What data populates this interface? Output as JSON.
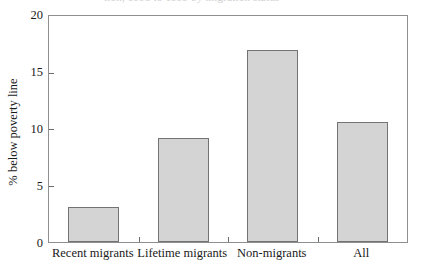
{
  "figure": {
    "top_clipped_text": "tion, 1993 to 1999 by migration status",
    "bar_fill_color": "#d4d4d4",
    "bar_edge_color": "#737373",
    "frame_color": "#8f8f8f"
  },
  "chart_data": {
    "type": "bar",
    "title": "",
    "subtitle": "",
    "xlabel": "",
    "ylabel": "% below poverty line",
    "categories": [
      "Recent migrants",
      "Lifetime migrants",
      "Non-migrants",
      "All"
    ],
    "values": [
      3.1,
      9.2,
      17.0,
      10.6
    ],
    "series": [
      {
        "name": "% below poverty line",
        "values": [
          3.1,
          9.2,
          17.0,
          10.6
        ]
      }
    ],
    "ylim": [
      0,
      20
    ],
    "ytick_labels": [
      "0",
      "5",
      "10",
      "15",
      "20"
    ],
    "ytick_values": [
      0,
      5,
      10,
      15,
      20
    ],
    "xtick_labels": [
      "Recent migrants",
      "Lifetime migrants",
      "Non-migrants",
      "All"
    ],
    "grid": false,
    "legend": null,
    "legend_position": "none",
    "annotations": []
  }
}
